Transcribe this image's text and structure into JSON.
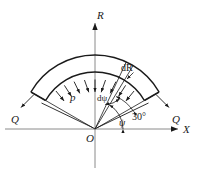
{
  "figure": {
    "type": "engineering-diagram",
    "background_color": "#ffffff",
    "line_color": "#1a1a1a"
  },
  "axes": {
    "vertical_label": "R",
    "horizontal_label": "X",
    "origin_label": "O"
  },
  "labels": {
    "pressure": "p",
    "end_force_left": "Q",
    "end_force_right": "Q",
    "radial_thickness": "dR",
    "angle_increment": "dψ",
    "angle": "ψ",
    "base_angle": "30°"
  },
  "geometry": {
    "origin_x": 95,
    "origin_y": 129,
    "inner_radius": 57,
    "outer_radius": 74,
    "start_angle_deg": 30,
    "end_angle_deg": 150,
    "pressure_arrow_count": 9,
    "element_angle_deg": 62,
    "element_width_deg": 6
  }
}
